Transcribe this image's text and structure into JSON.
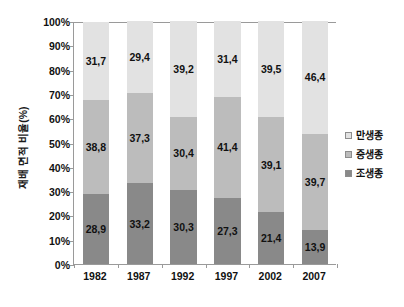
{
  "chart_data": {
    "type": "bar",
    "subtype": "100% stacked column",
    "title": "",
    "xlabel": "",
    "ylabel": "재배 면적 비율(%)",
    "categories": [
      "1982",
      "1987",
      "1992",
      "1997",
      "2002",
      "2007"
    ],
    "ylim": [
      0,
      100
    ],
    "ytick_labels": [
      "0%",
      "10%",
      "20%",
      "30%",
      "40%",
      "50%",
      "60%",
      "70%",
      "80%",
      "90%",
      "100%"
    ],
    "ytick_values": [
      0,
      10,
      20,
      30,
      40,
      50,
      60,
      70,
      80,
      90,
      100
    ],
    "grid": true,
    "legend_position": "right",
    "decimal_separator": ",",
    "stack_order_bottom_to_top": [
      "조생종",
      "중생종",
      "만생종"
    ],
    "series": [
      {
        "name": "조생종",
        "color": "#898989",
        "values": [
          28.9,
          33.2,
          30.3,
          27.3,
          21.4,
          13.9
        ],
        "labels": [
          "28,9",
          "33,2",
          "30,3",
          "27,3",
          "21,4",
          "13,9"
        ]
      },
      {
        "name": "중생종",
        "color": "#bcbcbc",
        "values": [
          38.8,
          37.3,
          30.4,
          41.4,
          39.1,
          39.7
        ],
        "labels": [
          "38,8",
          "37,3",
          "30,4",
          "41,4",
          "39,1",
          "39,7"
        ]
      },
      {
        "name": "만생종",
        "color": "#e2e2e2",
        "values": [
          31.7,
          29.4,
          39.2,
          31.4,
          39.5,
          46.4
        ],
        "labels": [
          "31,7",
          "29,4",
          "39,2",
          "31,4",
          "39,5",
          "46,4"
        ]
      }
    ],
    "legend_entries": [
      {
        "label": "만생종",
        "color": "#e2e2e2"
      },
      {
        "label": "중생종",
        "color": "#bcbcbc"
      },
      {
        "label": "조생종",
        "color": "#898989"
      }
    ],
    "colors": {
      "late": "#e2e2e2",
      "mid": "#bcbcbc",
      "early": "#898989",
      "axis": "#9a9a9a",
      "grid": "#d9d9d9",
      "text": "#111111",
      "background": "#ffffff"
    }
  },
  "footer": {
    "note": ""
  }
}
